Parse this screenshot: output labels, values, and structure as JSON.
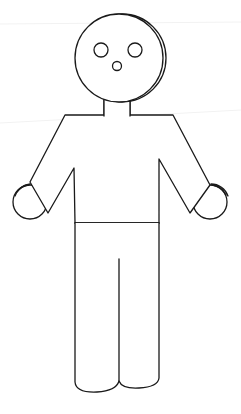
{
  "figure": {
    "style": "black outline on white",
    "colors": {
      "stroke": "#1a1a1a",
      "background": "#ffffff"
    },
    "parts": [
      "head",
      "left-eye",
      "right-eye",
      "nose",
      "neck",
      "torso",
      "left-arm",
      "right-arm",
      "left-hand",
      "right-hand",
      "waistband",
      "left-leg",
      "right-leg"
    ]
  }
}
